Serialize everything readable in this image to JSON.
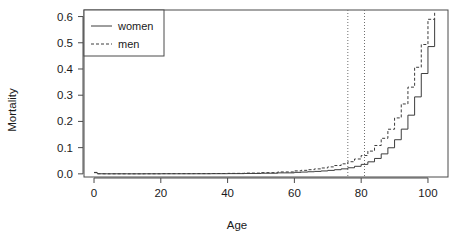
{
  "chart_data": {
    "type": "line",
    "title": "",
    "subtitle": "",
    "xlabel": "Age",
    "ylabel": "Mortality",
    "xlim": [
      -3,
      106
    ],
    "ylim": [
      -0.012,
      0.625
    ],
    "xticks": [
      0,
      20,
      40,
      60,
      80,
      100
    ],
    "xtick_labels": [
      "0",
      "20",
      "40",
      "60",
      "80",
      "100"
    ],
    "yticks": [
      0.0,
      0.1,
      0.2,
      0.3,
      0.4,
      0.5,
      0.6
    ],
    "ytick_labels": [
      "0.0",
      "0.1",
      "0.2",
      "0.3",
      "0.4",
      "0.5",
      "0.6"
    ],
    "grid": false,
    "legend_position": "top-left",
    "legend_entries": [
      {
        "label": "women",
        "style": "solid",
        "color": "#3c3c3c"
      },
      {
        "label": "men",
        "style": "dashed",
        "color": "#3c3c3c"
      }
    ],
    "annotations": [
      {
        "type": "vline",
        "x": 76,
        "style": "dotted",
        "color": "#6e6e6e",
        "label": ""
      },
      {
        "type": "vline",
        "x": 81,
        "style": "dotted",
        "color": "#6e6e6e",
        "label": ""
      }
    ],
    "x": [
      0,
      1,
      2,
      3,
      4,
      5,
      10,
      15,
      20,
      25,
      30,
      35,
      40,
      45,
      50,
      55,
      60,
      62,
      64,
      66,
      68,
      70,
      72,
      74,
      76,
      78,
      80,
      82,
      84,
      86,
      88,
      90,
      92,
      94,
      96,
      98,
      100,
      102
    ],
    "series": [
      {
        "name": "women",
        "style": "solid",
        "color": "#3c3c3c",
        "values": [
          0.0045,
          0.0004,
          0.0003,
          0.0002,
          0.0002,
          0.0002,
          0.0001,
          0.0002,
          0.0003,
          0.0003,
          0.0004,
          0.0006,
          0.0009,
          0.0015,
          0.0024,
          0.0038,
          0.0058,
          0.0068,
          0.008,
          0.0094,
          0.0111,
          0.0132,
          0.0158,
          0.019,
          0.0232,
          0.0288,
          0.0362,
          0.0459,
          0.0588,
          0.0762,
          0.0995,
          0.1302,
          0.1706,
          0.2238,
          0.2936,
          0.3827,
          0.4855,
          0.5905
        ]
      },
      {
        "name": "men",
        "style": "dashed",
        "color": "#3c3c3c",
        "values": [
          0.0055,
          0.0005,
          0.0003,
          0.0003,
          0.0002,
          0.0002,
          0.0002,
          0.0004,
          0.0008,
          0.0009,
          0.001,
          0.0013,
          0.0019,
          0.0029,
          0.0046,
          0.0073,
          0.0113,
          0.0134,
          0.0159,
          0.0189,
          0.0224,
          0.0266,
          0.0318,
          0.0382,
          0.0463,
          0.0567,
          0.0699,
          0.0868,
          0.1082,
          0.1356,
          0.1702,
          0.2134,
          0.2666,
          0.3308,
          0.4065,
          0.4934,
          0.5895,
          0.6205
        ]
      }
    ]
  }
}
